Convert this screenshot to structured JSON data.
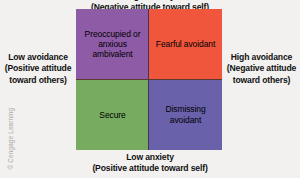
{
  "diagram": {
    "axes": {
      "top": {
        "name": "high-anxiety-axis-label",
        "lines": [
          "High anxiety",
          "(Negative attitude toward self)"
        ],
        "clipped": true
      },
      "bottom": {
        "name": "low-anxiety-axis-label",
        "lines": [
          "Low anxiety",
          "(Positive attitude toward self)"
        ]
      },
      "left": {
        "name": "low-avoidance-axis-label",
        "lines": [
          "Low avoidance",
          "(Positive attitude",
          "toward others)"
        ]
      },
      "right": {
        "name": "high-avoidance-axis-label",
        "lines": [
          "High avoidance",
          "(Negative attitude",
          "toward others)"
        ]
      }
    },
    "quadrants": [
      {
        "position": "top-left",
        "label": "Preoccupied or anxious ambivalent",
        "lines": [
          "Preoccupied",
          "or anxious",
          "ambivalent"
        ],
        "color": "#8e5ba6"
      },
      {
        "position": "top-right",
        "label": "Fearful avoidant",
        "lines": [
          "Fearful",
          "avoidant"
        ],
        "color": "#f0563c"
      },
      {
        "position": "bottom-left",
        "label": "Secure",
        "lines": [
          "Secure"
        ],
        "color": "#76ab60"
      },
      {
        "position": "bottom-right",
        "label": "Dismissing avoidant",
        "lines": [
          "Dismissing",
          "avoidant"
        ],
        "color": "#6a61ab"
      }
    ],
    "credit": "© Cengage Learning",
    "background_color": "#f2f1ef",
    "divider_color": "#4a2f57"
  },
  "chart_data": {
    "type": "table",
    "xlabel": "Anxiety (attitude toward self)",
    "ylabel": "Avoidance (attitude toward others)",
    "x_axis_poles": {
      "low": "Low anxiety (Positive attitude toward self)",
      "high": "High anxiety (Negative attitude toward self)"
    },
    "y_axis_poles": {
      "low": "Low avoidance (Positive attitude toward others)",
      "high": "High avoidance (Negative attitude toward others)"
    },
    "categories": [
      "Preoccupied or anxious ambivalent",
      "Fearful avoidant",
      "Secure",
      "Dismissing avoidant"
    ],
    "cells": [
      {
        "label": "Preoccupied or anxious ambivalent",
        "anxiety": "high",
        "avoidance": "low",
        "quadrant": "top-left",
        "color": "#8e5ba6"
      },
      {
        "label": "Fearful avoidant",
        "anxiety": "high",
        "avoidance": "high",
        "quadrant": "top-right",
        "color": "#f0563c"
      },
      {
        "label": "Secure",
        "anxiety": "low",
        "avoidance": "low",
        "quadrant": "bottom-left",
        "color": "#76ab60"
      },
      {
        "label": "Dismissing avoidant",
        "anxiety": "low",
        "avoidance": "high",
        "quadrant": "bottom-right",
        "color": "#6a61ab"
      }
    ],
    "grid": true,
    "legend": false
  }
}
